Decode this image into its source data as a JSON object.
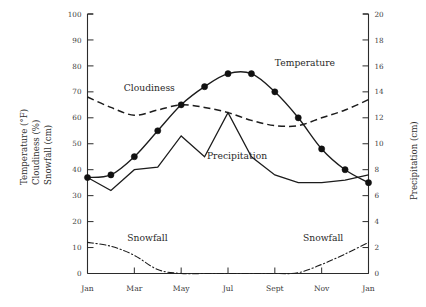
{
  "chart_data": {
    "type": "line",
    "title": "",
    "xlabel": "",
    "ylabel": "Temperature (°F)  Cloudiness (%)  Snowfall (cm)",
    "y2label": "Precipitation (cm)",
    "ylim": [
      0,
      100
    ],
    "y2lim": [
      0,
      20
    ],
    "xlim": [
      0,
      12
    ],
    "grid": false,
    "legend": "inline-labels",
    "x": [
      0,
      1,
      2,
      3,
      4,
      5,
      6,
      7,
      8,
      9,
      10,
      11,
      12
    ],
    "x_tick_positions": [
      0,
      2,
      4,
      6,
      8,
      10,
      12
    ],
    "categories": [
      "Jan",
      "Feb",
      "Mar",
      "Apr",
      "May",
      "Jun",
      "Jul",
      "Aug",
      "Sept",
      "Oct",
      "Nov",
      "Dec",
      "Jan"
    ],
    "xtick_labels": [
      "Jan",
      "Mar",
      "May",
      "Jul",
      "Sept",
      "Nov",
      "Jan"
    ],
    "ytick_labels": [
      "0",
      "10",
      "20",
      "30",
      "40",
      "50",
      "60",
      "70",
      "80",
      "90",
      "100"
    ],
    "ytick_values": [
      0,
      10,
      20,
      30,
      40,
      50,
      60,
      70,
      80,
      90,
      100
    ],
    "y2tick_labels": [
      "0",
      "2",
      "4",
      "6",
      "8",
      "10",
      "12",
      "14",
      "16",
      "18",
      "20"
    ],
    "y2tick_values": [
      0,
      2,
      4,
      6,
      8,
      10,
      12,
      14,
      16,
      18,
      20
    ],
    "series": [
      {
        "name": "Temperature",
        "axis": "left",
        "units": "°F",
        "style": "solid-with-markers",
        "marker": "filled-circle",
        "label_x": 8.0,
        "label_y": 80,
        "values": [
          37,
          38,
          45,
          55,
          65,
          72,
          77,
          77,
          70,
          60,
          48,
          40,
          35
        ]
      },
      {
        "name": "Cloudiness",
        "axis": "left",
        "units": "%",
        "style": "dashed",
        "marker": "none",
        "label_x": 1.55,
        "label_y": 70.5,
        "values": [
          68,
          64,
          61,
          63,
          65,
          64,
          62,
          59,
          57,
          57,
          60,
          63,
          67
        ]
      },
      {
        "name": "Precipitation",
        "axis": "right",
        "units": "cm",
        "style": "solid",
        "marker": "none",
        "label_x": 5.1,
        "label_y": 44,
        "values": [
          7.4,
          6.4,
          8.0,
          8.2,
          10.6,
          9.0,
          12.4,
          9.0,
          7.6,
          7.0,
          7.0,
          7.2,
          7.6
        ]
      },
      {
        "name": "Snowfall",
        "axis": "left",
        "units": "cm",
        "style": "dash-dot",
        "marker": "none",
        "label_x": 1.7,
        "label_y": 12.5,
        "label_x_2": 9.2,
        "label_y_2": 12.5,
        "values": [
          12,
          10.5,
          7,
          1.5,
          0,
          0,
          0,
          0,
          0,
          0.3,
          3.5,
          7.5,
          12
        ]
      }
    ],
    "annotations": [
      {
        "text": "Temperature",
        "x": 8.0,
        "y": 80
      },
      {
        "text": "Cloudiness",
        "x": 1.55,
        "y": 70.5
      },
      {
        "text": "Precipitation",
        "x": 5.1,
        "y": 44
      },
      {
        "text": "Snowfall",
        "x": 1.7,
        "y": 12.5
      },
      {
        "text": "Snowfall",
        "x": 9.2,
        "y": 12.5
      }
    ]
  },
  "axes": {
    "left_title_lines": [
      "Temperature (°F)",
      "Cloudiness (%)",
      "Snowfall (cm)"
    ],
    "right_title": "Precipitation (cm)"
  }
}
